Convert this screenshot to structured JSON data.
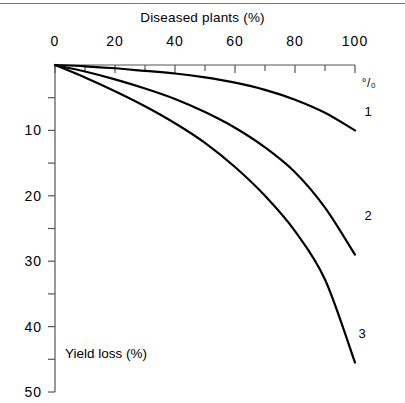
{
  "chart_data": {
    "type": "line",
    "title": "Diseased plants (%)",
    "xlabel": "Diseased plants (%)",
    "ylabel": "Yield loss (%)",
    "xlim": [
      0,
      100
    ],
    "ylim": [
      0,
      50
    ],
    "y_axis_inverted": true,
    "grid": false,
    "legend_position": "inline-right",
    "x_major_ticks": [
      0,
      20,
      40,
      60,
      80,
      100
    ],
    "x_minor_tick_interval": 10,
    "y_major_ticks": [
      10,
      20,
      30,
      40,
      50
    ],
    "y_minor_tick_interval": 5,
    "x_tick_labels": [
      "0",
      "20",
      "40",
      "60",
      "80",
      "100"
    ],
    "y_tick_labels": [
      "10",
      "20",
      "30",
      "40",
      "50"
    ],
    "unit_symbol": "°/₀",
    "axis_annotation": "Yield loss (%)",
    "x": [
      0,
      10,
      20,
      30,
      40,
      50,
      60,
      70,
      80,
      90,
      100
    ],
    "series": [
      {
        "name": "1",
        "label": "1",
        "values": [
          0,
          0.2,
          0.5,
          0.9,
          1.3,
          1.9,
          2.7,
          3.8,
          5.3,
          7.3,
          10.0
        ]
      },
      {
        "name": "2",
        "label": "2",
        "values": [
          0,
          1.0,
          2.2,
          3.6,
          5.2,
          7.2,
          9.6,
          12.6,
          16.4,
          21.8,
          29.0
        ]
      },
      {
        "name": "3",
        "label": "3",
        "values": [
          0,
          1.9,
          4.0,
          6.3,
          8.9,
          11.9,
          15.6,
          20.0,
          25.4,
          32.8,
          45.5
        ]
      }
    ],
    "series_label_positions": [
      {
        "label": "1",
        "x": 100,
        "y": 7.0
      },
      {
        "label": "2",
        "x": 100,
        "y": 23.0
      },
      {
        "label": "3",
        "x": 98,
        "y": 41.0
      }
    ]
  }
}
